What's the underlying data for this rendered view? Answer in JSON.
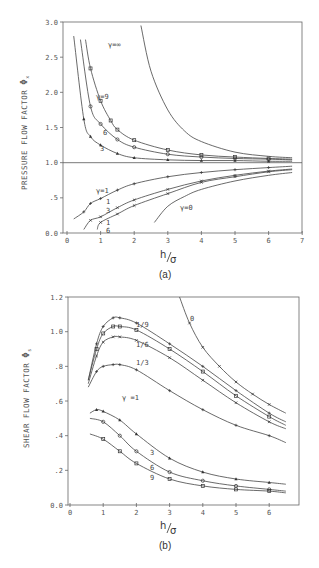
{
  "chart_data": [
    {
      "id": "a",
      "type": "line",
      "caption": "(a)",
      "title": "",
      "xlabel": "h/σ",
      "ylabel": "PRESSURE FLOW FACTOR Φx",
      "xlim": [
        0,
        7
      ],
      "ylim": [
        0,
        3.0
      ],
      "xticks": [
        "0",
        "1",
        "2",
        "3",
        "4",
        "5",
        "6",
        "7"
      ],
      "yticks": [
        "0.0",
        ".5",
        "1.0",
        "1.5",
        "2.0",
        "2.5",
        "3.0"
      ],
      "grid": false,
      "reference_line": 1.0,
      "series": [
        {
          "name": "γ=∞",
          "x": [
            2.2,
            2.5,
            3,
            3.5,
            4,
            5,
            6,
            6.7
          ],
          "y": [
            2.95,
            2.3,
            1.75,
            1.45,
            1.3,
            1.15,
            1.09,
            1.07
          ]
        },
        {
          "name": "γ=9",
          "x": [
            0.55,
            0.7,
            1.0,
            1.3,
            1.5,
            2.0,
            3.0,
            4.0,
            5.0,
            6.0,
            6.7
          ],
          "y": [
            2.75,
            2.34,
            1.88,
            1.6,
            1.47,
            1.32,
            1.18,
            1.11,
            1.08,
            1.06,
            1.05
          ]
        },
        {
          "name": "6",
          "x": [
            0.4,
            0.7,
            1.0,
            1.5,
            2.0,
            3.0,
            4.0,
            5.0,
            6.0,
            6.7
          ],
          "y": [
            2.75,
            1.8,
            1.55,
            1.33,
            1.22,
            1.12,
            1.08,
            1.06,
            1.05,
            1.04
          ]
        },
        {
          "name": "3",
          "x": [
            0.2,
            0.5,
            0.7,
            1.0,
            1.5,
            2.0,
            3.0,
            4.0,
            5.0,
            6.0,
            6.7
          ],
          "y": [
            2.8,
            1.62,
            1.37,
            1.25,
            1.13,
            1.07,
            1.04,
            1.03,
            1.03,
            1.02,
            1.02
          ]
        },
        {
          "name": "γ=1",
          "x": [
            0.2,
            0.5,
            0.7,
            1.0,
            1.5,
            2.0,
            3.0,
            4.0,
            5.0,
            6.0,
            6.7
          ],
          "y": [
            0.2,
            0.3,
            0.42,
            0.49,
            0.61,
            0.7,
            0.8,
            0.86,
            0.9,
            0.93,
            0.95
          ]
        },
        {
          "name": "1/3",
          "x": [
            0.5,
            0.7,
            1.0,
            1.5,
            2.0,
            3.0,
            4.0,
            5.0,
            6.0,
            6.7
          ],
          "y": [
            0.05,
            0.18,
            0.23,
            0.36,
            0.47,
            0.62,
            0.74,
            0.82,
            0.88,
            0.91
          ]
        },
        {
          "name": "1/6",
          "x": [
            0.9,
            1.0,
            1.5,
            2.0,
            3.0,
            4.0,
            5.0,
            6.0,
            6.7
          ],
          "y": [
            0.05,
            0.15,
            0.27,
            0.39,
            0.56,
            0.72,
            0.8,
            0.87,
            0.9
          ]
        },
        {
          "name": "γ=0",
          "x": [
            2.6,
            3.0,
            3.5,
            4.0,
            5.0,
            6.0,
            6.7
          ],
          "y": [
            0.15,
            0.38,
            0.52,
            0.62,
            0.74,
            0.82,
            0.86
          ]
        }
      ],
      "annotations": [
        "γ=∞",
        "γ=9",
        "6",
        "3",
        "γ=1",
        "1/3",
        "1/6",
        "γ=0"
      ]
    },
    {
      "id": "b",
      "type": "line",
      "caption": "(b)",
      "title": "",
      "xlabel": "h/σ",
      "ylabel": "SHEAR FLOW FACTOR Φs",
      "xlim": [
        0,
        7
      ],
      "ylim": [
        0,
        1.2
      ],
      "xticks": [
        "0",
        "1",
        "2",
        "3",
        "4",
        "5",
        "6"
      ],
      "yticks": [
        "0.0",
        ".2",
        ".4",
        ".6",
        ".8",
        "1.0",
        "1.2"
      ],
      "grid": false,
      "series": [
        {
          "name": "0",
          "x": [
            3.3,
            3.6,
            4.0,
            4.5,
            5.0,
            5.5,
            6.0,
            6.5
          ],
          "y": [
            1.2,
            1.05,
            0.91,
            0.8,
            0.71,
            0.64,
            0.58,
            0.53
          ]
        },
        {
          "name": "1/9",
          "x": [
            0.55,
            0.8,
            1.0,
            1.3,
            1.5,
            2.0,
            3.0,
            4.0,
            5.0,
            6.0,
            6.5
          ],
          "y": [
            0.72,
            0.93,
            1.03,
            1.08,
            1.08,
            1.05,
            0.93,
            0.8,
            0.66,
            0.53,
            0.48
          ]
        },
        {
          "name": "1/6",
          "x": [
            0.55,
            0.8,
            1.0,
            1.3,
            1.5,
            2.0,
            3.0,
            4.0,
            5.0,
            6.0,
            6.5
          ],
          "y": [
            0.72,
            0.9,
            0.99,
            1.03,
            1.03,
            1.01,
            0.9,
            0.77,
            0.63,
            0.51,
            0.46
          ]
        },
        {
          "name": "1/3",
          "x": [
            0.55,
            0.8,
            1.0,
            1.3,
            1.5,
            2.0,
            3.0,
            4.0,
            5.0,
            6.0,
            6.5
          ],
          "y": [
            0.7,
            0.86,
            0.94,
            0.97,
            0.97,
            0.95,
            0.85,
            0.72,
            0.59,
            0.48,
            0.44
          ]
        },
        {
          "name": "γ=1",
          "x": [
            0.55,
            0.8,
            1.0,
            1.3,
            1.5,
            2.0,
            3.0,
            4.0,
            5.0,
            6.0,
            6.5
          ],
          "y": [
            0.68,
            0.77,
            0.8,
            0.81,
            0.81,
            0.78,
            0.66,
            0.55,
            0.46,
            0.4,
            0.36
          ]
        },
        {
          "name": "3",
          "x": [
            0.6,
            0.8,
            1.0,
            1.5,
            2.0,
            3.0,
            4.0,
            5.0,
            6.0,
            6.5
          ],
          "y": [
            0.53,
            0.55,
            0.54,
            0.49,
            0.41,
            0.27,
            0.19,
            0.15,
            0.13,
            0.12
          ]
        },
        {
          "name": "6",
          "x": [
            0.6,
            1.0,
            1.5,
            2.0,
            3.0,
            4.0,
            5.0,
            6.0,
            6.5
          ],
          "y": [
            0.5,
            0.48,
            0.4,
            0.31,
            0.19,
            0.14,
            0.11,
            0.09,
            0.08
          ]
        },
        {
          "name": "9",
          "x": [
            0.6,
            1.0,
            1.5,
            2.0,
            3.0,
            4.0,
            5.0,
            6.0,
            6.5
          ],
          "y": [
            0.41,
            0.38,
            0.31,
            0.24,
            0.15,
            0.11,
            0.09,
            0.08,
            0.07
          ]
        }
      ],
      "annotations": [
        "0",
        "1/9",
        "1/6",
        "1/3",
        "γ=1",
        "3",
        "6",
        "9"
      ]
    }
  ],
  "figure": {
    "a": {
      "caption": "(a)",
      "ylabel": "PRESSURE FLOW FACTOR",
      "ylabel_symbol": "Φ",
      "ylabel_sub": "x",
      "xlabel_num": "h",
      "xlabel_den": "σ",
      "labels": {
        "inf": "γ=∞",
        "g9": "γ=9",
        "g6": "6",
        "g3": "3",
        "g1": "γ=1",
        "g13n": "1",
        "g13d": "3",
        "g16n": "1",
        "g16d": "6",
        "g0": "γ=0"
      }
    },
    "b": {
      "caption": "(b)",
      "ylabel": "SHEAR FLOW FACTOR",
      "ylabel_symbol": "Φ",
      "ylabel_sub": "s",
      "xlabel_num": "h",
      "xlabel_den": "σ",
      "labels": {
        "g0": "0",
        "g19": "1/9",
        "g16": "1/6",
        "g13": "1/3",
        "g1": "γ =1",
        "g3": "3",
        "g6": "6",
        "g9": "9"
      }
    }
  }
}
